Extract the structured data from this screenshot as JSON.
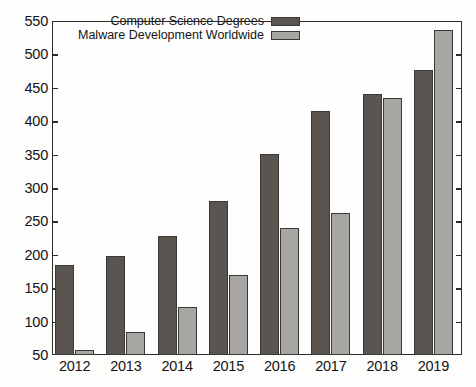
{
  "chart_data": {
    "type": "bar",
    "title": "",
    "subtitle": "",
    "xlabel": "",
    "ylabel": "",
    "categories": [
      "2012",
      "2013",
      "2014",
      "2015",
      "2016",
      "2017",
      "2018",
      "2019"
    ],
    "series": [
      {
        "name": "Computer Science Degrees",
        "color": "#5a5550",
        "values": [
          185,
          198,
          228,
          281,
          351,
          416,
          440,
          476
        ]
      },
      {
        "name": "Malware Development Worldwide",
        "color": "#a8a6a3",
        "values": [
          58,
          85,
          122,
          170,
          240,
          262,
          434,
          536
        ]
      }
    ],
    "ylim": [
      50,
      550
    ],
    "ytick_step": 50,
    "yticks": [
      50,
      100,
      150,
      200,
      250,
      300,
      350,
      400,
      450,
      500,
      550
    ],
    "ytick_labels": [
      "50",
      "100",
      "150",
      "200",
      "250",
      "300",
      "350",
      "400",
      "450",
      "500",
      "550"
    ],
    "grid": false,
    "legend_position": "top-center-inside",
    "tick_direction": "in",
    "axes_visible": [
      "left",
      "right",
      "top",
      "bottom"
    ]
  },
  "legend": {
    "entries": [
      {
        "label": "Computer Science Degrees",
        "swatch": "dark-gray-swatch"
      },
      {
        "label": "Malware Development Worldwide",
        "swatch": "light-gray-swatch"
      }
    ]
  },
  "colors": {
    "series_dark": "#5a5550",
    "series_light": "#a8a6a3",
    "axis": "#2b2b2b",
    "text": "#141414",
    "background": "#fdfdfc"
  }
}
